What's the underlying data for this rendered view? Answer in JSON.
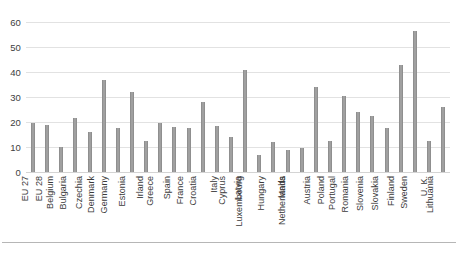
{
  "chart_data": {
    "type": "bar",
    "title": "",
    "subtitle": "",
    "xlabel": "",
    "ylabel": "",
    "ylim": [
      0,
      60
    ],
    "yticks": [
      0,
      10,
      20,
      30,
      40,
      50,
      60
    ],
    "grid": true,
    "legend": false,
    "legend_position": "none",
    "bar_color": "#a0a0a0",
    "gridline_color": "#e2e2e2",
    "categories": [
      "EU 27",
      "EU 28",
      "Belgium",
      "Bulgaria",
      "Czechia",
      "Denmark",
      "Germany",
      "Estonia",
      "Irland",
      "Greece",
      "Spain",
      "France",
      "Croatia",
      "Italy",
      "Cyprus",
      "Latvia",
      "Luxembourg",
      "Hungary",
      "Malta",
      "Netherlands",
      "Austria",
      "Poland",
      "Portugal",
      "Romania",
      "Slovenia",
      "Slovakia",
      "Finland",
      "Sweden",
      "U. K.",
      "Lithuania"
    ],
    "values": [
      19.5,
      19,
      10,
      21.5,
      16,
      37,
      17.5,
      32,
      12.5,
      19.5,
      18,
      17.5,
      28,
      18.5,
      14,
      41,
      7,
      12,
      9,
      9.5,
      34,
      12.5,
      30.5,
      24,
      22.5,
      17.5,
      43,
      56.5,
      12.5,
      26
    ]
  }
}
